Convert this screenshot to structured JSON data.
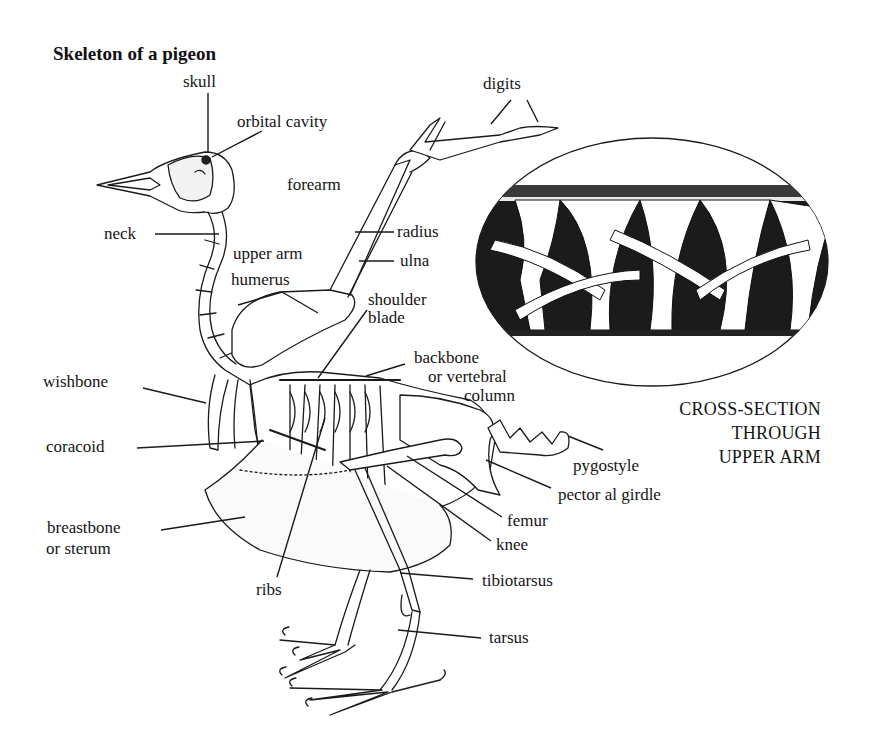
{
  "title": "Skeleton of a pigeon",
  "labels": {
    "skull": "skull",
    "orbital_cavity": "orbital cavity",
    "digits": "digits",
    "forearm": "forearm",
    "neck": "neck",
    "radius": "radius",
    "ulna": "ulna",
    "upper_arm": "upper arm",
    "humerus": "humerus",
    "shoulder": "shoulder",
    "blade": "blade",
    "backbone": "backbone",
    "or_vertebral": "or vertebral",
    "column": "column",
    "wishbone": "wishbone",
    "coracoid": "coracoid",
    "breastbone": "breastbone",
    "or_sternum": "or sterum",
    "ribs": "ribs",
    "pygostyle": "pygostyle",
    "pectoral_girdle": "pector al girdle",
    "femur": "femur",
    "knee": "knee",
    "tibiotarsus": "tibiotarsus",
    "tarsus": "tarsus"
  },
  "inset": {
    "caption_line1": "CROSS-SECTION",
    "caption_line2": "THROUGH",
    "caption_line3": "UPPER ARM"
  }
}
